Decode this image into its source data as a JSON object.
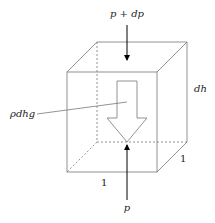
{
  "diagram": {
    "labels": {
      "top_pressure": "p + dp",
      "bottom_pressure": "p",
      "weight": "ρdhg",
      "height": "dh",
      "width": "1",
      "depth": "1"
    },
    "colors": {
      "edge": "#777777",
      "arrow": "#000000",
      "text": "#222222"
    }
  }
}
